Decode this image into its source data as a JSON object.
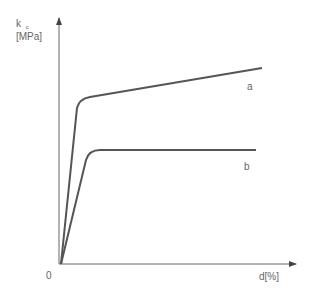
{
  "diagram": {
    "y_axis_label_line1": "k",
    "y_axis_label_sub": "c",
    "y_axis_label_line2": "[MPa]",
    "x_axis_label": "d[%]",
    "origin_label": "0",
    "curves": [
      {
        "id": "a",
        "label": "a",
        "description": "yield then linear hardening"
      },
      {
        "id": "b",
        "label": "b",
        "description": "yield then flat plateau"
      }
    ],
    "colors": {
      "axis": "#555555",
      "curve": "#555555",
      "text": "#666666"
    }
  }
}
